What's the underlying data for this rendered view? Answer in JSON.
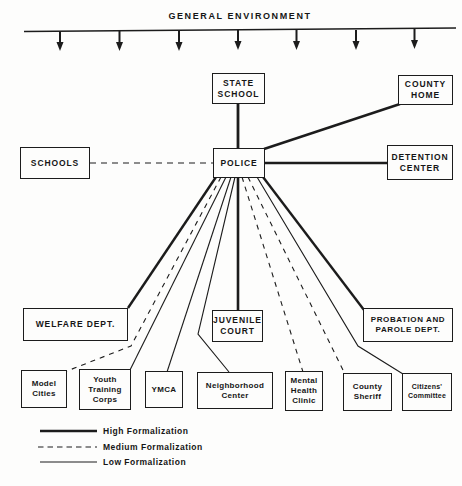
{
  "title": "GENERAL ENVIRONMENT",
  "nodes": {
    "state_school": {
      "label": "STATE\nSCHOOL"
    },
    "county_home": {
      "label": "COUNTY\nHOME"
    },
    "schools": {
      "label": "SCHOOLS"
    },
    "police": {
      "label": "POLICE"
    },
    "detention_center": {
      "label": "DETENTION\nCENTER"
    },
    "welfare_dept": {
      "label": "WELFARE DEPT."
    },
    "juvenile_court": {
      "label": "JUVENILE\nCOURT"
    },
    "probation_parole": {
      "label": "PROBATION AND\nPAROLE DEPT."
    },
    "model_cities": {
      "label": "Model\nCities"
    },
    "youth_training": {
      "label": "Youth\nTraining\nCorps"
    },
    "ymca": {
      "label": "YMCA"
    },
    "neighborhood": {
      "label": "Neighborhood\nCenter"
    },
    "mental_health": {
      "label": "Mental\nHealth\nClinic"
    },
    "county_sheriff": {
      "label": "County\nSheriff"
    },
    "citizens_committee": {
      "label": "Citizens'\nCommittee"
    }
  },
  "edges": [
    {
      "from": "state_school",
      "to": "police",
      "formalization": "high"
    },
    {
      "from": "county_home",
      "to": "police",
      "formalization": "high"
    },
    {
      "from": "detention_center",
      "to": "police",
      "formalization": "high"
    },
    {
      "from": "schools",
      "to": "police",
      "formalization": "medium"
    },
    {
      "from": "welfare_dept",
      "to": "police",
      "formalization": "high"
    },
    {
      "from": "juvenile_court",
      "to": "police",
      "formalization": "high"
    },
    {
      "from": "probation_parole",
      "to": "police",
      "formalization": "high"
    },
    {
      "from": "model_cities",
      "to": "police",
      "formalization": "medium"
    },
    {
      "from": "youth_training",
      "to": "police",
      "formalization": "low"
    },
    {
      "from": "ymca",
      "to": "police",
      "formalization": "low"
    },
    {
      "from": "neighborhood",
      "to": "police",
      "formalization": "low"
    },
    {
      "from": "mental_health",
      "to": "police",
      "formalization": "medium"
    },
    {
      "from": "county_sheriff",
      "to": "police",
      "formalization": "medium"
    },
    {
      "from": "citizens_committee",
      "to": "police",
      "formalization": "low"
    }
  ],
  "legend": {
    "items": [
      {
        "style": "high",
        "label": "High Formalization"
      },
      {
        "style": "medium",
        "label": "Medium Formalization"
      },
      {
        "style": "low",
        "label": "Low Formalization"
      }
    ]
  },
  "colors": {
    "ink": "#1c1c1c",
    "paper": "#fdfdfc"
  }
}
